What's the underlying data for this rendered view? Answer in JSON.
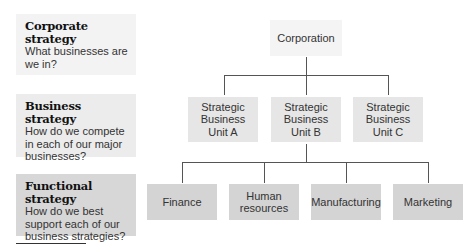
{
  "levels": [
    {
      "title": "Corporate strategy",
      "question": "What businesses are we in?"
    },
    {
      "title": "Business strategy",
      "question": "How do we compete in each of our major businesses?"
    },
    {
      "title": "Functional strategy",
      "question": "How do we best support each of our business strategies?"
    }
  ],
  "hierarchy": {
    "root": {
      "label": "Corporation"
    },
    "business_units": [
      {
        "label": "Strategic\nBusiness\nUnit A"
      },
      {
        "label": "Strategic\nBusiness\nUnit B"
      },
      {
        "label": "Strategic\nBusiness\nUnit C"
      }
    ],
    "functions": [
      {
        "label": "Finance"
      },
      {
        "label": "Human\nresources"
      },
      {
        "label": "Manufacturing"
      },
      {
        "label": "Marketing"
      }
    ]
  },
  "colors": {
    "corporate_level": "#f3f3f3",
    "business_level": "#ececec",
    "functional_level": "#d7d7d7",
    "connector": "#555555"
  }
}
